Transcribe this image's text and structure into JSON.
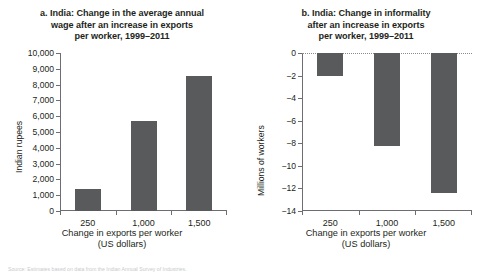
{
  "figure": {
    "source_note": "Source: Estimates based on data from the Indian Annual Survey of Industries."
  },
  "chart_data": [
    {
      "type": "bar",
      "panel": "a",
      "title": "a. India: Change in the average annual wage after an increase in exports per worker, 1999–2011",
      "title_lines": [
        "a. India: Change in the average annual",
        "wage after an increase in exports",
        "per worker, 1999–2011"
      ],
      "categories": [
        "250",
        "1,000",
        "1,500"
      ],
      "values": [
        1400,
        5700,
        8550
      ],
      "xlabel": "Change in exports per worker (US dollars)",
      "xlabel_lines": [
        "Change in exports per worker",
        "(US dollars)"
      ],
      "ylabel": "Indian rupees",
      "ylim": [
        0,
        10000
      ],
      "ytick_values": [
        0,
        1000,
        2000,
        3000,
        4000,
        5000,
        6000,
        7000,
        8000,
        9000,
        10000
      ],
      "ytick_labels": [
        "0",
        "1,000",
        "2,000",
        "3,000",
        "4,000",
        "5,000",
        "6,000",
        "7,000",
        "8,000",
        "9,000",
        "10,000"
      ],
      "grid": false,
      "legend": "none",
      "bar_color": "#595a5c"
    },
    {
      "type": "bar",
      "panel": "b",
      "title": "b. India: Change in informality after an increase in exports per worker, 1999–2011",
      "title_lines": [
        "b. India: Change in informality",
        "after an increase in exports",
        "per worker, 1999–2011"
      ],
      "categories": [
        "250",
        "1,000",
        "1,500"
      ],
      "values": [
        -2.0,
        -8.2,
        -12.4
      ],
      "xlabel": "Change in exports per worker (US dollars)",
      "xlabel_lines": [
        "Change in exports per worker",
        "(US dollars)"
      ],
      "ylabel": "Millions of workers",
      "ylim": [
        -14,
        0
      ],
      "ytick_values": [
        0,
        -2,
        -4,
        -6,
        -8,
        -10,
        -12,
        -14
      ],
      "ytick_labels": [
        "0",
        "−2",
        "−4",
        "−6",
        "−8",
        "−10",
        "−12",
        "−14"
      ],
      "grid": false,
      "zero_baseline": true,
      "legend": "none",
      "bar_color": "#595a5c"
    }
  ]
}
